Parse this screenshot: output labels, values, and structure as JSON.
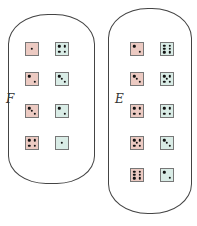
{
  "colors": {
    "red_die": "#eccac2",
    "green_die": "#d9ece6",
    "pip": "#111111",
    "outline": "#444444"
  },
  "sets": [
    {
      "id": "F",
      "label": "F",
      "pairs": [
        {
          "red": 1,
          "green": 4
        },
        {
          "red": 2,
          "green": 3
        },
        {
          "red": 3,
          "green": 2
        },
        {
          "red": 4,
          "green": 1
        }
      ]
    },
    {
      "id": "E",
      "label": "E",
      "pairs": [
        {
          "red": 2,
          "green": 6
        },
        {
          "red": 3,
          "green": 5
        },
        {
          "red": 4,
          "green": 4
        },
        {
          "red": 5,
          "green": 3
        },
        {
          "red": 6,
          "green": 2
        }
      ]
    }
  ]
}
